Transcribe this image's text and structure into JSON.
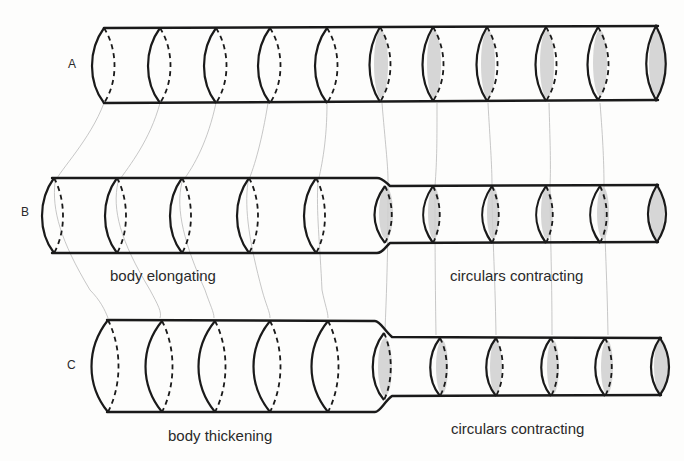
{
  "figure": {
    "rows": [
      {
        "id": "A",
        "label": "A",
        "caption_left": "",
        "caption_right": ""
      },
      {
        "id": "B",
        "label": "B",
        "caption_left": "body elongating",
        "caption_right": "circulars contracting"
      },
      {
        "id": "C",
        "label": "C",
        "caption_left": "body thickening",
        "caption_right": "circulars contracting"
      }
    ],
    "colors": {
      "outline": "#1a1a1a",
      "shading": "#cfcfcf",
      "guide_lines": "#b9b9b9",
      "background": "#fdfdfc"
    }
  }
}
